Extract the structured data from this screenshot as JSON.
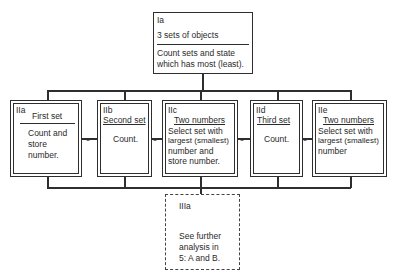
{
  "diagram": {
    "top_node": {
      "id": "Ia",
      "title": "3 sets of objects",
      "body_line1": "Count sets and state",
      "body_line2": "which has most (least)."
    },
    "middle_nodes": [
      {
        "id": "IIa",
        "title": "First set",
        "body_line1": "Count and",
        "body_line2": "store",
        "body_line3": "number."
      },
      {
        "id": "IIb",
        "title": "Second set",
        "body_line1": "Count."
      },
      {
        "id": "IIc",
        "title": "Two numbers",
        "body_line1": "Select set with",
        "body_line2": "largest (smallest)",
        "body_line3": "number and",
        "body_line4": "store number."
      },
      {
        "id": "IId",
        "title": "Third set",
        "body_line1": "Count."
      },
      {
        "id": "IIe",
        "title": "Two numbers",
        "body_line1": "Select set with",
        "body_line2": "largest (smallest)",
        "body_line3": "number"
      }
    ],
    "bottom_node": {
      "id": "IIIa",
      "body_line1": "See further",
      "body_line2": "analysis in",
      "body_line3": "5: A and B.",
      "style": "dashed"
    },
    "colors": {
      "line": "#2e2e2e",
      "background": "#ffffff"
    }
  }
}
